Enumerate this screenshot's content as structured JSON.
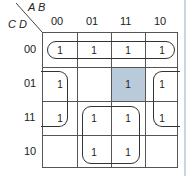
{
  "kmap": {
    "row_var": "C D",
    "col_var": "A B",
    "col_labels": [
      "00",
      "01",
      "11",
      "10"
    ],
    "row_labels": [
      "00",
      "01",
      "11",
      "10"
    ],
    "cells": [
      [
        "1",
        "1",
        "1",
        "1"
      ],
      [
        "1",
        "",
        "1",
        "1"
      ],
      [
        "1",
        "1",
        "1",
        "1"
      ],
      [
        "",
        "1",
        "1",
        ""
      ]
    ],
    "highlighted_cell": {
      "row": 1,
      "col": 2,
      "color": "#b9cadb"
    },
    "groups": [
      "Row 00 across all columns",
      "Left-right wrap: rows 01-11, columns 00 and 10",
      "Center 2x2: rows 11-10, columns 01-11"
    ]
  }
}
